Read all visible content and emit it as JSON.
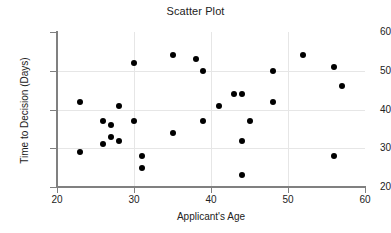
{
  "chart_data": {
    "type": "scatter",
    "title": "Scatter Plot",
    "xlabel": "Applicant's Age",
    "ylabel": "Time to Decision (Days)",
    "xlim": [
      20,
      60
    ],
    "ylim": [
      20,
      60
    ],
    "xticks": [
      20,
      30,
      40,
      50,
      60
    ],
    "yticks": [
      20,
      30,
      40,
      50,
      60
    ],
    "grid": true,
    "legend": null,
    "marker": {
      "shape": "circle",
      "color": "#000000",
      "size": 6
    },
    "points": [
      {
        "x": 23,
        "y": 42
      },
      {
        "x": 23,
        "y": 29
      },
      {
        "x": 26,
        "y": 37
      },
      {
        "x": 26,
        "y": 31
      },
      {
        "x": 27,
        "y": 36
      },
      {
        "x": 27,
        "y": 33
      },
      {
        "x": 28,
        "y": 41
      },
      {
        "x": 28,
        "y": 32
      },
      {
        "x": 30,
        "y": 52
      },
      {
        "x": 30,
        "y": 37
      },
      {
        "x": 31,
        "y": 28
      },
      {
        "x": 31,
        "y": 25
      },
      {
        "x": 35,
        "y": 54
      },
      {
        "x": 35,
        "y": 34
      },
      {
        "x": 38,
        "y": 53
      },
      {
        "x": 39,
        "y": 50
      },
      {
        "x": 39,
        "y": 37
      },
      {
        "x": 41,
        "y": 41
      },
      {
        "x": 43,
        "y": 44
      },
      {
        "x": 44,
        "y": 44
      },
      {
        "x": 44,
        "y": 32
      },
      {
        "x": 44,
        "y": 23
      },
      {
        "x": 45,
        "y": 37
      },
      {
        "x": 48,
        "y": 50
      },
      {
        "x": 48,
        "y": 42
      },
      {
        "x": 52,
        "y": 54
      },
      {
        "x": 56,
        "y": 51
      },
      {
        "x": 56,
        "y": 28
      },
      {
        "x": 57,
        "y": 46
      }
    ]
  }
}
